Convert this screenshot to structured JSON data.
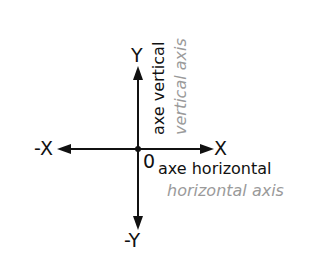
{
  "diagram": {
    "origin_label": "0",
    "x_positive_label": "X",
    "x_negative_label": "-X",
    "y_positive_label": "Y",
    "y_negative_label": "-Y",
    "horizontal_axis": {
      "label_fr": "axe horizontal",
      "label_en": "horizontal axis"
    },
    "vertical_axis": {
      "label_fr": "axe vertical",
      "label_en": "vertical axis"
    },
    "colors": {
      "axis_line": "#111111",
      "primary_text": "#111111",
      "translation_text": "#9a9a9a"
    }
  }
}
